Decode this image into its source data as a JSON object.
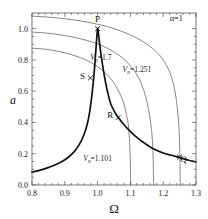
{
  "chart_data": {
    "type": "line",
    "title": "",
    "xlabel": "Ω",
    "ylabel": "a",
    "xlim": [
      0.8,
      1.3
    ],
    "ylim": [
      0.0,
      1.1
    ],
    "grid": false,
    "legend_position": "inline-annotations",
    "xticks": [
      "0.8",
      "0.9",
      "1.0",
      "1.1",
      "1.2",
      "1.3"
    ],
    "xtick_values": [
      0.8,
      0.9,
      1.0,
      1.1,
      1.2,
      1.3
    ],
    "yticks": [
      "0.0",
      "0.2",
      "0.4",
      "0.6",
      "0.8",
      "1.0"
    ],
    "ytick_values": [
      0.0,
      0.2,
      0.4,
      0.6,
      0.8,
      1.0
    ],
    "annotations": [
      {
        "name": "alpha-annotation",
        "text": "α=1",
        "x": 1.24,
        "y": 1.05
      },
      {
        "name": "curve-label-v17",
        "symbol": "V",
        "sub": "n",
        "eq": "=",
        "value": "1.7",
        "x": 1.01,
        "y": 0.8
      },
      {
        "name": "curve-label-v1251",
        "symbol": "V",
        "sub": "n",
        "eq": "=",
        "value": "1.251",
        "x": 1.12,
        "y": 0.72
      },
      {
        "name": "curve-label-v1101",
        "symbol": "V",
        "sub": "n",
        "eq": "=",
        "value": "1.101",
        "x": 1.0,
        "y": 0.155
      }
    ],
    "points": [
      {
        "label": "P",
        "x": 1.0,
        "y": 1.0
      },
      {
        "label": "S",
        "x": 0.978,
        "y": 0.685
      },
      {
        "label": "R",
        "x": 1.063,
        "y": 0.432
      },
      {
        "label": "Q",
        "x": 1.25,
        "y": 0.178
      }
    ],
    "series": [
      {
        "name": "V_n=1.7",
        "style": "thin",
        "x": [
          0.8,
          0.85,
          0.9,
          0.94,
          0.97,
          1.0,
          1.02,
          1.04,
          1.055,
          1.07,
          1.08,
          1.09,
          1.095,
          1.099,
          1.101
        ],
        "values": [
          0.875,
          0.866,
          0.845,
          0.82,
          0.794,
          0.757,
          0.724,
          0.679,
          0.636,
          0.575,
          0.52,
          0.43,
          0.355,
          0.205,
          0.0
        ]
      },
      {
        "name": "V_n=1.251",
        "style": "thin",
        "x": [
          0.8,
          0.86,
          0.92,
          0.97,
          1.01,
          1.05,
          1.08,
          1.105,
          1.125,
          1.14,
          1.152,
          1.162,
          1.168,
          1.171
        ],
        "values": [
          0.978,
          0.968,
          0.948,
          0.923,
          0.894,
          0.851,
          0.805,
          0.75,
          0.686,
          0.61,
          0.52,
          0.395,
          0.25,
          0.0
        ]
      },
      {
        "name": "V_n=1.101",
        "style": "thin",
        "x": [
          0.8,
          0.87,
          0.94,
          1.0,
          1.05,
          1.1,
          1.14,
          1.175,
          1.2,
          1.22,
          1.235,
          1.245,
          1.25,
          1.252
        ],
        "values": [
          1.08,
          1.07,
          1.052,
          1.028,
          1.0,
          0.96,
          0.915,
          0.86,
          0.8,
          0.72,
          0.61,
          0.45,
          0.27,
          0.0
        ]
      },
      {
        "name": "response-backbone",
        "style": "bold",
        "x": [
          0.8,
          0.82,
          0.845,
          0.87,
          0.89,
          0.91,
          0.928,
          0.944,
          0.958,
          0.968,
          0.976,
          0.984,
          0.99,
          0.995,
          1.0,
          1.004,
          1.01,
          1.018,
          1.028,
          1.04,
          1.052,
          1.063,
          1.078,
          1.095,
          1.115,
          1.14,
          1.17,
          1.2,
          1.225,
          1.25,
          1.275,
          1.3
        ],
        "values": [
          0.082,
          0.092,
          0.108,
          0.128,
          0.148,
          0.176,
          0.212,
          0.258,
          0.32,
          0.385,
          0.47,
          0.6,
          0.73,
          0.87,
          1.0,
          0.94,
          0.84,
          0.73,
          0.618,
          0.52,
          0.468,
          0.432,
          0.392,
          0.352,
          0.312,
          0.272,
          0.232,
          0.205,
          0.19,
          0.175,
          0.16,
          0.148
        ]
      }
    ]
  }
}
